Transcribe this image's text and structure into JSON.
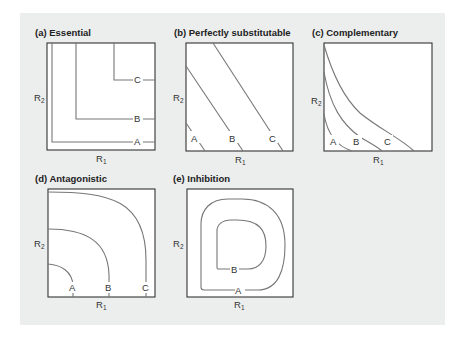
{
  "figure": {
    "background_color": "#eceded",
    "curve_color": "#777777",
    "panels": [
      {
        "id": "a",
        "title": "(a) Essential",
        "x_axis": "R",
        "x_axis_sub": "1",
        "y_axis": "R",
        "y_axis_sub": "2",
        "curve_labels": [
          "A",
          "B",
          "C"
        ]
      },
      {
        "id": "b",
        "title": "(b) Perfectly substitutable",
        "x_axis": "R",
        "x_axis_sub": "1",
        "y_axis": "R",
        "y_axis_sub": "2",
        "curve_labels": [
          "A",
          "B",
          "C"
        ]
      },
      {
        "id": "c",
        "title": "(c) Complementary",
        "x_axis": "R",
        "x_axis_sub": "1",
        "y_axis": "R",
        "y_axis_sub": "2",
        "curve_labels": [
          "A",
          "B",
          "C"
        ]
      },
      {
        "id": "d",
        "title": "(d) Antagonistic",
        "x_axis": "R",
        "x_axis_sub": "1",
        "y_axis": "R",
        "y_axis_sub": "2",
        "curve_labels": [
          "A",
          "B",
          "C"
        ]
      },
      {
        "id": "e",
        "title": "(e) Inhibition",
        "x_axis": "R",
        "x_axis_sub": "1",
        "y_axis": "R",
        "y_axis_sub": "2",
        "curve_labels": [
          "A",
          "B"
        ]
      }
    ]
  }
}
